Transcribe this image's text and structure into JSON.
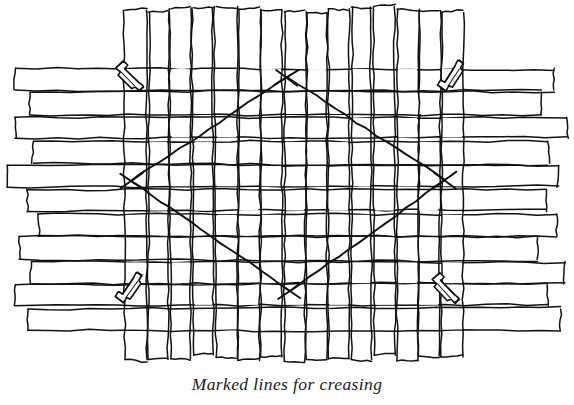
{
  "figure": {
    "title": "Marked lines for creasing",
    "caption": "Marked lines for creasing",
    "colors": {
      "ink": "#111111",
      "background": "#ffffff",
      "caption_ink": "#1a1a1a"
    },
    "canvas": {
      "width": 574,
      "height": 405
    }
  },
  "weave": {
    "label": "woven-strip-mat",
    "vertical_strips": {
      "count": 15,
      "x_start": 136,
      "x_end": 452,
      "y_top": 6,
      "y_bottom": 362,
      "gap": 2.2
    },
    "horizontal_strips": {
      "count": 11,
      "y_start": 80,
      "y_end": 320,
      "x_left": 8,
      "x_right": 566,
      "gap": 2.4,
      "ragged_left_ends": [
        18,
        30,
        14,
        34,
        8,
        24,
        38,
        20,
        32,
        16,
        26
      ],
      "ragged_right_ends": [
        552,
        540,
        566,
        548,
        560,
        544,
        556,
        538,
        562,
        546,
        558
      ]
    }
  },
  "crease_diamond": {
    "label": "marked-crease-lines",
    "vertices": [
      {
        "name": "top-vertex",
        "x": 287,
        "y": 77
      },
      {
        "name": "right-vertex",
        "x": 445,
        "y": 180
      },
      {
        "name": "bottom-vertex",
        "x": 290,
        "y": 291
      },
      {
        "name": "left-vertex",
        "x": 131,
        "y": 181
      }
    ],
    "vertex_marker": "x-mark",
    "marker_count": 4
  },
  "clips": [
    {
      "name": "clip-top-left",
      "x": 129,
      "y": 78,
      "angle": 52
    },
    {
      "name": "clip-top-right",
      "x": 453,
      "y": 76,
      "angle": -50
    },
    {
      "name": "clip-bottom-left",
      "x": 131,
      "y": 288,
      "angle": -48
    },
    {
      "name": "clip-bottom-right",
      "x": 445,
      "y": 290,
      "angle": 54
    }
  ]
}
